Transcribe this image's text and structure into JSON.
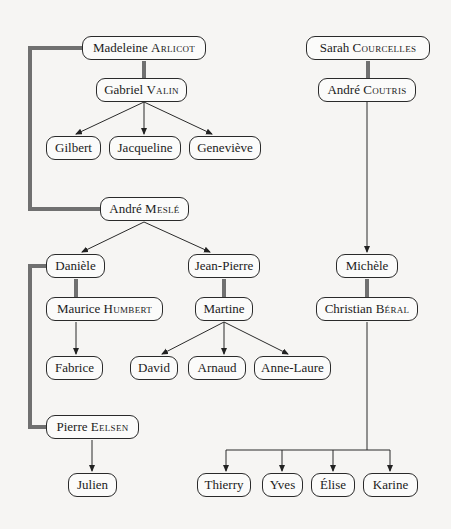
{
  "diagram": {
    "type": "family-tree",
    "nodes": [
      {
        "id": "madeleine",
        "first": "Madeleine",
        "last": "Arlicot",
        "x": 82,
        "y": 36,
        "w": 124
      },
      {
        "id": "gabriel",
        "first": "Gabriel",
        "last": "Valin",
        "x": 96,
        "y": 78,
        "w": 91
      },
      {
        "id": "gilbert",
        "first": "Gilbert",
        "last": "",
        "x": 46,
        "y": 136,
        "w": 55
      },
      {
        "id": "jacqueline",
        "first": "Jacqueline",
        "last": "",
        "x": 109,
        "y": 136,
        "w": 72
      },
      {
        "id": "genevieve",
        "first": "Geneviève",
        "last": "",
        "x": 189,
        "y": 136,
        "w": 72
      },
      {
        "id": "andre_mesle",
        "first": "André",
        "last": "Meslé",
        "x": 100,
        "y": 197,
        "w": 89
      },
      {
        "id": "daniele",
        "first": "Danièle",
        "last": "",
        "x": 46,
        "y": 254,
        "w": 59
      },
      {
        "id": "maurice",
        "first": "Maurice",
        "last": "Humbert",
        "x": 46,
        "y": 297,
        "w": 117
      },
      {
        "id": "fabrice",
        "first": "Fabrice",
        "last": "",
        "x": 46,
        "y": 356,
        "w": 57
      },
      {
        "id": "pierre",
        "first": "Pierre",
        "last": "Eelsen",
        "x": 46,
        "y": 415,
        "w": 93
      },
      {
        "id": "julien",
        "first": "Julien",
        "last": "",
        "x": 68,
        "y": 473,
        "w": 49
      },
      {
        "id": "jean_pierre",
        "first": "Jean-Pierre",
        "last": "",
        "x": 188,
        "y": 254,
        "w": 72
      },
      {
        "id": "martine",
        "first": "Martine",
        "last": "",
        "x": 195,
        "y": 297,
        "w": 58
      },
      {
        "id": "david",
        "first": "David",
        "last": "",
        "x": 130,
        "y": 356,
        "w": 48
      },
      {
        "id": "arnaud",
        "first": "Arnaud",
        "last": "",
        "x": 188,
        "y": 356,
        "w": 58
      },
      {
        "id": "anne_laure",
        "first": "Anne-Laure",
        "last": "",
        "x": 254,
        "y": 356,
        "w": 77
      },
      {
        "id": "sarah",
        "first": "Sarah",
        "last": "Courcelles",
        "x": 306,
        "y": 36,
        "w": 124
      },
      {
        "id": "andre_coutris",
        "first": "André",
        "last": "Coutris",
        "x": 318,
        "y": 78,
        "w": 98
      },
      {
        "id": "michele",
        "first": "Michèle",
        "last": "",
        "x": 336,
        "y": 254,
        "w": 62
      },
      {
        "id": "christian",
        "first": "Christian",
        "last": "Béral",
        "x": 316,
        "y": 297,
        "w": 102
      },
      {
        "id": "thierry",
        "first": "Thierry",
        "last": "",
        "x": 197,
        "y": 473,
        "w": 54
      },
      {
        "id": "yves",
        "first": "Yves",
        "last": "",
        "x": 262,
        "y": 473,
        "w": 41
      },
      {
        "id": "elise",
        "first": "Élise",
        "last": "",
        "x": 311,
        "y": 473,
        "w": 44
      },
      {
        "id": "karine",
        "first": "Karine",
        "last": "",
        "x": 363,
        "y": 473,
        "w": 55
      }
    ],
    "marriages": [
      [
        "madeleine",
        "gabriel"
      ],
      [
        "madeleine",
        "andre_mesle"
      ],
      [
        "daniele",
        "maurice"
      ],
      [
        "daniele",
        "pierre"
      ],
      [
        "jean_pierre",
        "martine"
      ],
      [
        "sarah",
        "andre_coutris"
      ],
      [
        "michele",
        "christian"
      ]
    ],
    "children": [
      {
        "parents": "madeleine+gabriel",
        "children": [
          "gilbert",
          "jacqueline",
          "genevieve"
        ]
      },
      {
        "parents": "madeleine+andre_mesle",
        "children": [
          "daniele",
          "jean_pierre"
        ]
      },
      {
        "parents": "daniele+maurice",
        "children": [
          "fabrice"
        ]
      },
      {
        "parents": "daniele+pierre",
        "children": [
          "julien"
        ]
      },
      {
        "parents": "jean_pierre+martine",
        "children": [
          "david",
          "arnaud",
          "anne_laure"
        ]
      },
      {
        "parents": "sarah+andre_coutris",
        "children": [
          "michele"
        ]
      },
      {
        "parents": "michele+christian",
        "children": [
          "thierry",
          "yves",
          "elise",
          "karine"
        ]
      }
    ],
    "colors": {
      "marriage_line": "#6b6b6b",
      "arrow_line": "#2a2a2a",
      "background": "#f6f5f3"
    }
  }
}
